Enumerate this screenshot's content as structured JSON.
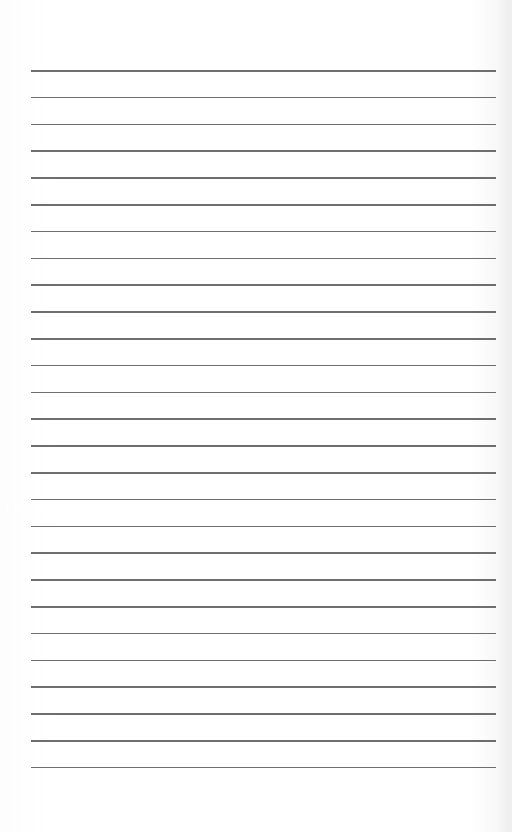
{
  "page": {
    "type": "lined-paper",
    "background_color": "#ffffff",
    "line_color": "#555555",
    "line_count": 27,
    "first_line_y": 70,
    "line_spacing": 26.8,
    "line_left_x": 31,
    "line_right_x": 496
  },
  "lines": [
    {
      "index": 1
    },
    {
      "index": 2
    },
    {
      "index": 3
    },
    {
      "index": 4
    },
    {
      "index": 5
    },
    {
      "index": 6
    },
    {
      "index": 7
    },
    {
      "index": 8
    },
    {
      "index": 9
    },
    {
      "index": 10
    },
    {
      "index": 11
    },
    {
      "index": 12
    },
    {
      "index": 13
    },
    {
      "index": 14
    },
    {
      "index": 15
    },
    {
      "index": 16
    },
    {
      "index": 17
    },
    {
      "index": 18
    },
    {
      "index": 19
    },
    {
      "index": 20
    },
    {
      "index": 21
    },
    {
      "index": 22
    },
    {
      "index": 23
    },
    {
      "index": 24
    },
    {
      "index": 25
    },
    {
      "index": 26
    },
    {
      "index": 27
    }
  ]
}
